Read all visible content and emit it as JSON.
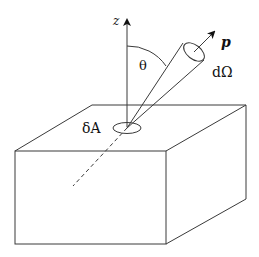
{
  "diagram": {
    "labels": {
      "z_axis": "z",
      "theta": "θ",
      "momentum": "p",
      "solid_angle": "dΩ",
      "area_element": "δA"
    },
    "colors": {
      "stroke": "#3a3a3a",
      "background": "#ffffff",
      "text": "#111111"
    }
  }
}
